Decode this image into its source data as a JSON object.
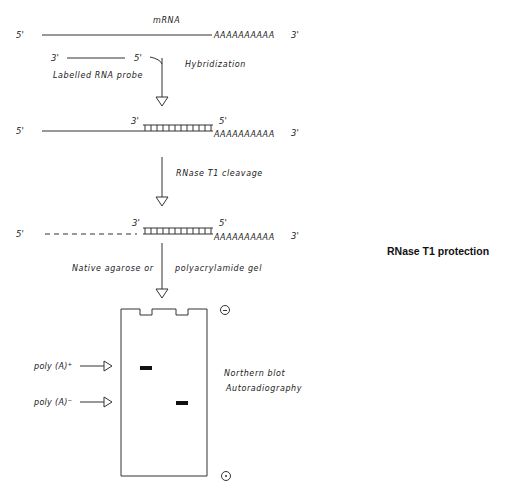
{
  "title": "RNase T1 protection",
  "step1": {
    "mrna_label": "mRNA",
    "five_prime": "5'",
    "three_prime": "3'",
    "poly_a_tail": "AAAAAAAAAA",
    "probe_three_prime": "3'",
    "probe_five_prime": "5'",
    "probe_label": "Labelled RNA probe",
    "action": "Hybridization"
  },
  "step2": {
    "five_prime": "5'",
    "three_prime": "3'",
    "probe_three_prime": "3'",
    "probe_five_prime": "5'",
    "poly_a_tail": "AAAAAAAAAA",
    "action": "RNase T1 cleavage"
  },
  "step3": {
    "five_prime": "5'",
    "three_prime": "3'",
    "probe_three_prime": "3'",
    "probe_five_prime": "5'",
    "poly_a_tail": "AAAAAAAAAA",
    "action_left": "Native agarose or",
    "action_right": "polyacrylamide gel"
  },
  "gel": {
    "cathode_symbol": "−",
    "anode_symbol": "+",
    "bands": [
      {
        "label": "poly (A)",
        "superscript": "+",
        "lane": 1
      },
      {
        "label": "poly (A)",
        "superscript": "−",
        "lane": 2
      }
    ],
    "method_line1": "Northern blot",
    "method_line2": "Autoradiography"
  }
}
